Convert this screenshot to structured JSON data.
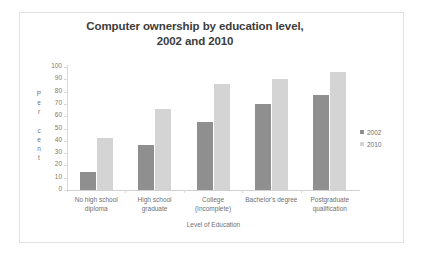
{
  "chart_data": {
    "type": "bar",
    "title": "Computer ownership by education level, 2002 and 2010",
    "title_lines": [
      "Computer ownership by education level,",
      "2002 and 2010"
    ],
    "xlabel": "Level of Education",
    "ylabel": "Percent",
    "ylabel_chars": [
      "P",
      "e",
      "r",
      "",
      "c",
      "e",
      "n",
      "t"
    ],
    "ylim": [
      0,
      100
    ],
    "ytick_step": 10,
    "yticks": [
      100,
      90,
      80,
      70,
      60,
      50,
      40,
      30,
      20,
      10,
      0
    ],
    "grid": false,
    "legend_position": "right",
    "categories": [
      "No high school diploma",
      "High school graduate",
      "College (Incomplete)",
      "Bachelor's degree",
      "Postgraduate qualification"
    ],
    "category_lines": [
      [
        "No high school",
        "diploma"
      ],
      [
        "High school",
        "graduate"
      ],
      [
        "College",
        "(Incomplete)"
      ],
      [
        "Bachelor's degree"
      ],
      [
        "Postgraduate",
        "qualification"
      ]
    ],
    "series": [
      {
        "name": "2002",
        "color": "#8f8f8f",
        "values": [
          15,
          37,
          55,
          70,
          77
        ]
      },
      {
        "name": "2010",
        "color": "#d4d4d4",
        "values": [
          42,
          66,
          86,
          90,
          96
        ]
      }
    ]
  },
  "legend": {
    "entries": [
      {
        "label": "2002",
        "color": "#8f8f8f"
      },
      {
        "label": "2010",
        "color": "#d4d4d4"
      }
    ]
  },
  "colors": {
    "series_2002": "#8f8f8f",
    "series_2010": "#d4d4d4",
    "frame": "#e2e2e2",
    "axis": "#d9d9d9",
    "text": "#6f6f6f",
    "title_text": "#3d3d3d",
    "background": "#ffffff"
  }
}
